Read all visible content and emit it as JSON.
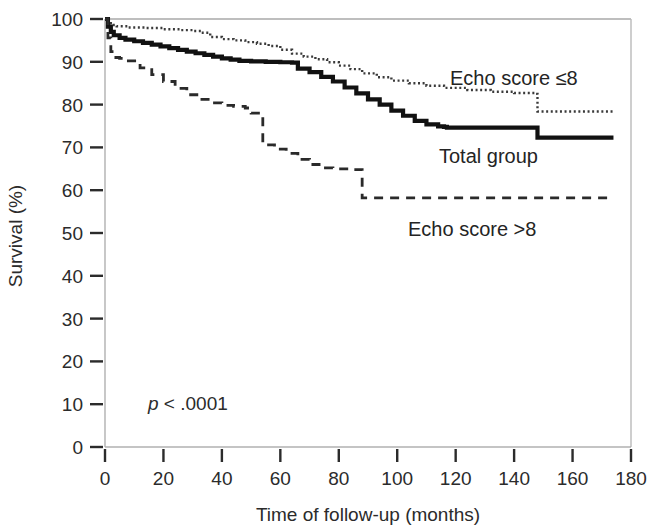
{
  "chart_data": {
    "type": "line",
    "title": "",
    "xlabel": "Time of follow-up (months)",
    "ylabel": "Survival (%)",
    "xlim": [
      0,
      180
    ],
    "ylim": [
      0,
      100
    ],
    "xticks": [
      0,
      20,
      40,
      60,
      80,
      100,
      120,
      140,
      160,
      180
    ],
    "yticks": [
      0,
      10,
      20,
      30,
      40,
      50,
      60,
      70,
      80,
      90,
      100
    ],
    "xtick_labels": [
      "0",
      "20",
      "40",
      "60",
      "80",
      "100",
      "120",
      "140",
      "160",
      "180"
    ],
    "ytick_labels": [
      "0",
      "10",
      "20",
      "30",
      "40",
      "50",
      "60",
      "70",
      "80",
      "90",
      "100"
    ],
    "grid": false,
    "legend_position": "inline-annotations",
    "annotations": [
      {
        "name": "p-value",
        "text_italic": "p",
        "text": " < .0001",
        "x": 16,
        "y": 9
      },
      {
        "name": "echo-score-le8-label",
        "text": "Echo score ≤8",
        "x": 122,
        "y": 84
      },
      {
        "name": "total-group-label",
        "text": "Total group",
        "x": 118,
        "y": 70
      },
      {
        "name": "echo-score-gt8-label",
        "text": "Echo score >8",
        "x": 102,
        "y": 55
      }
    ],
    "series": [
      {
        "name": "Echo score ≤8",
        "style": "dotted",
        "color": "#3a3a3a",
        "points": [
          [
            0,
            100
          ],
          [
            1,
            99
          ],
          [
            2,
            98.6
          ],
          [
            4,
            98.3
          ],
          [
            8,
            98.0
          ],
          [
            14,
            97.9
          ],
          [
            20,
            97.6
          ],
          [
            26,
            97.4
          ],
          [
            30,
            97.2
          ],
          [
            33,
            96.8
          ],
          [
            36,
            95.8
          ],
          [
            40,
            95.3
          ],
          [
            44,
            95.0
          ],
          [
            48,
            94.6
          ],
          [
            52,
            94.2
          ],
          [
            56,
            93.7
          ],
          [
            60,
            92.8
          ],
          [
            64,
            91.9
          ],
          [
            68,
            91.2
          ],
          [
            72,
            90.6
          ],
          [
            76,
            89.9
          ],
          [
            80,
            89.1
          ],
          [
            84,
            88.3
          ],
          [
            88,
            87.3
          ],
          [
            93,
            86.4
          ],
          [
            98,
            85.6
          ],
          [
            104,
            85.0
          ],
          [
            110,
            84.4
          ],
          [
            116,
            83.9
          ],
          [
            124,
            83.4
          ],
          [
            132,
            83.0
          ],
          [
            140,
            82.7
          ],
          [
            147,
            82.5
          ],
          [
            148,
            78.4
          ],
          [
            160,
            78.4
          ],
          [
            174,
            78.4
          ]
        ]
      },
      {
        "name": "Total group",
        "style": "solid",
        "color": "#111111",
        "points": [
          [
            0,
            100
          ],
          [
            1,
            98.2
          ],
          [
            2,
            97.0
          ],
          [
            3,
            96.2
          ],
          [
            5,
            95.6
          ],
          [
            7,
            95.2
          ],
          [
            10,
            94.8
          ],
          [
            13,
            94.4
          ],
          [
            16,
            94.0
          ],
          [
            19,
            93.6
          ],
          [
            22,
            93.2
          ],
          [
            25,
            92.8
          ],
          [
            28,
            92.4
          ],
          [
            31,
            92.0
          ],
          [
            34,
            91.6
          ],
          [
            37,
            91.2
          ],
          [
            40,
            90.8
          ],
          [
            43,
            90.5
          ],
          [
            46,
            90.2
          ],
          [
            50,
            90.1
          ],
          [
            55,
            90.0
          ],
          [
            60,
            89.9
          ],
          [
            64,
            89.8
          ],
          [
            66,
            88.4
          ],
          [
            70,
            87.6
          ],
          [
            74,
            86.5
          ],
          [
            78,
            85.4
          ],
          [
            82,
            84.0
          ],
          [
            86,
            82.6
          ],
          [
            90,
            81.2
          ],
          [
            94,
            80.0
          ],
          [
            98,
            78.6
          ],
          [
            102,
            77.4
          ],
          [
            106,
            76.2
          ],
          [
            110,
            75.4
          ],
          [
            114,
            74.9
          ],
          [
            116,
            74.8
          ],
          [
            117,
            74.6
          ],
          [
            118,
            74.6
          ],
          [
            147,
            74.6
          ],
          [
            148,
            72.3
          ],
          [
            160,
            72.3
          ],
          [
            174,
            72.3
          ]
        ]
      },
      {
        "name": "Echo score >8",
        "style": "dashed",
        "color": "#2a2a2a",
        "points": [
          [
            0,
            100
          ],
          [
            1,
            95.6
          ],
          [
            2,
            92.4
          ],
          [
            3,
            91.0
          ],
          [
            5,
            90.8
          ],
          [
            8,
            90.2
          ],
          [
            12,
            88.6
          ],
          [
            16,
            87.0
          ],
          [
            20,
            85.4
          ],
          [
            24,
            83.8
          ],
          [
            28,
            82.3
          ],
          [
            32,
            81.2
          ],
          [
            36,
            80.4
          ],
          [
            40,
            79.8
          ],
          [
            44,
            79.6
          ],
          [
            48,
            79.2
          ],
          [
            50,
            78.0
          ],
          [
            53,
            77.6
          ],
          [
            54,
            70.6
          ],
          [
            58,
            69.6
          ],
          [
            62,
            68.6
          ],
          [
            66,
            67.2
          ],
          [
            70,
            66.0
          ],
          [
            74,
            65.2
          ],
          [
            78,
            65.0
          ],
          [
            84,
            64.8
          ],
          [
            87,
            64.8
          ],
          [
            88,
            58.2
          ],
          [
            100,
            58.2
          ],
          [
            120,
            58.2
          ],
          [
            140,
            58.2
          ],
          [
            160,
            58.2
          ],
          [
            174,
            58.2
          ]
        ]
      }
    ]
  },
  "layout": {
    "plot_left": 105,
    "plot_right": 631,
    "plot_top": 19,
    "plot_bottom": 447
  }
}
